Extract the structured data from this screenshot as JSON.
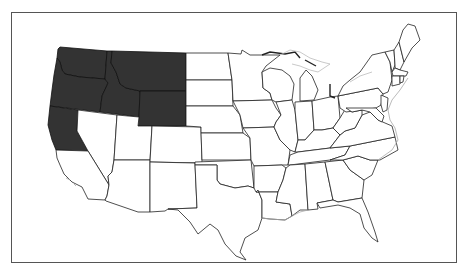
{
  "map": {
    "title": "",
    "region": "Contiguous United States",
    "highlight_color": "#333333",
    "base_color": "#ffffff",
    "border_color": "#222222",
    "highlighted_states": [
      "Washington",
      "Oregon",
      "California (northern)",
      "Idaho",
      "Montana",
      "Wyoming"
    ],
    "unhighlighted_states": [
      "Nevada",
      "Utah",
      "Arizona",
      "Colorado",
      "New Mexico",
      "North Dakota",
      "South Dakota",
      "Nebraska",
      "Kansas",
      "Oklahoma",
      "Texas",
      "Minnesota",
      "Iowa",
      "Missouri",
      "Arkansas",
      "Louisiana",
      "Wisconsin",
      "Illinois",
      "Michigan",
      "Indiana",
      "Ohio",
      "Kentucky",
      "Tennessee",
      "Mississippi",
      "Alabama",
      "Georgia",
      "Florida",
      "South Carolina",
      "North Carolina",
      "Virginia",
      "West Virginia",
      "Maryland",
      "Delaware",
      "Pennsylvania",
      "New Jersey",
      "New York",
      "Connecticut",
      "Rhode Island",
      "Massachusetts",
      "Vermont",
      "New Hampshire",
      "Maine",
      "California (southern)"
    ]
  }
}
